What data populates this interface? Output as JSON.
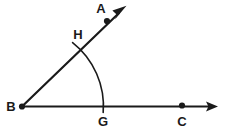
{
  "figure": {
    "type": "geometry-diagram",
    "background_color": "#ffffff",
    "ink_color": "#1a1a1a",
    "labels": {
      "a": "A",
      "b": "B",
      "c": "C",
      "g": "G",
      "h": "H"
    },
    "points": {
      "a": {
        "label": "A",
        "dot_x": 107,
        "dot_y": 21,
        "label_x": 101,
        "label_y": 13
      },
      "b": {
        "label": "B",
        "dot_x": 22,
        "dot_y": 106,
        "label_x": 6,
        "label_y": 111
      },
      "c": {
        "label": "C",
        "dot_x": 182,
        "dot_y": 106,
        "label_x": 176,
        "label_y": 126
      },
      "g": {
        "label": "G",
        "dot_x": 103,
        "dot_y": 106,
        "label_x": 97,
        "label_y": 126
      },
      "h": {
        "label": "H",
        "dot_x": 77,
        "dot_y": 49,
        "label_x": 72,
        "label_y": 40
      }
    },
    "rays": {
      "ba": {
        "from_x": 22,
        "from_y": 106,
        "to_x": 126,
        "to_y": 6,
        "arrow": true
      },
      "bc": {
        "from_x": 22,
        "from_y": 106,
        "to_x": 218,
        "to_y": 106,
        "arrow": true
      }
    },
    "arc": {
      "center_x": 22,
      "center_y": 106,
      "radius": 81,
      "start_x": 73,
      "start_y": 43,
      "end_x": 103,
      "end_y": 112
    }
  }
}
